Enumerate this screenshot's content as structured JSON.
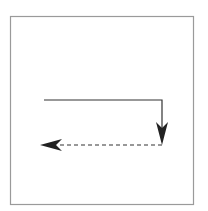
{
  "diagram": {
    "type": "flow-arrows",
    "frame": {
      "x": 10,
      "y": 16,
      "width": 183,
      "height": 188,
      "stroke": "#9a9a9a"
    },
    "solid_path": {
      "points": [
        [
          44,
          100
        ],
        [
          162,
          100
        ],
        [
          162,
          140
        ]
      ],
      "stroke": "#333333",
      "arrow": "down"
    },
    "dashed_path": {
      "points": [
        [
          162,
          145
        ],
        [
          52,
          145
        ]
      ],
      "stroke": "#333333",
      "arrow": "left"
    },
    "colors": {
      "line": "#333333",
      "frame": "#9a9a9a",
      "background": "#ffffff"
    }
  }
}
